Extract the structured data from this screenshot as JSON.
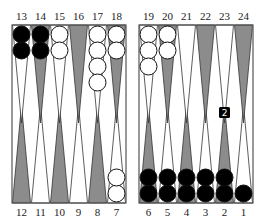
{
  "board": {
    "colors": {
      "background": "#ffffff",
      "frame": "#555555",
      "dark_point": "#8c8c8c",
      "light_point": "#ffffff",
      "black_checker": "#000000",
      "white_checker": "#ffffff"
    },
    "top_left_labels": [
      "13",
      "14",
      "15",
      "16",
      "17",
      "18"
    ],
    "top_right_labels": [
      "19",
      "20",
      "21",
      "22",
      "23",
      "24"
    ],
    "bottom_left_labels": [
      "12",
      "11",
      "10",
      "9",
      "8",
      "7"
    ],
    "bottom_right_labels": [
      "6",
      "5",
      "4",
      "3",
      "2",
      "1"
    ],
    "points": [
      {
        "point": 13,
        "checkers": 2,
        "color": "black"
      },
      {
        "point": 14,
        "checkers": 2,
        "color": "black"
      },
      {
        "point": 15,
        "checkers": 2,
        "color": "white"
      },
      {
        "point": 16,
        "checkers": 0,
        "color": null
      },
      {
        "point": 17,
        "checkers": 4,
        "color": "white"
      },
      {
        "point": 18,
        "checkers": 2,
        "color": "white"
      },
      {
        "point": 19,
        "checkers": 3,
        "color": "white"
      },
      {
        "point": 20,
        "checkers": 2,
        "color": "white"
      },
      {
        "point": 21,
        "checkers": 0,
        "color": null
      },
      {
        "point": 22,
        "checkers": 0,
        "color": null
      },
      {
        "point": 23,
        "checkers": 0,
        "color": null
      },
      {
        "point": 24,
        "checkers": 0,
        "color": null
      },
      {
        "point": 12,
        "checkers": 0,
        "color": null
      },
      {
        "point": 11,
        "checkers": 0,
        "color": null
      },
      {
        "point": 10,
        "checkers": 0,
        "color": null
      },
      {
        "point": 9,
        "checkers": 0,
        "color": null
      },
      {
        "point": 8,
        "checkers": 0,
        "color": null
      },
      {
        "point": 7,
        "checkers": 2,
        "color": "white"
      },
      {
        "point": 6,
        "checkers": 2,
        "color": "black"
      },
      {
        "point": 5,
        "checkers": 2,
        "color": "black"
      },
      {
        "point": 4,
        "checkers": 2,
        "color": "black"
      },
      {
        "point": 3,
        "checkers": 2,
        "color": "black"
      },
      {
        "point": 2,
        "checkers": 2,
        "color": "black"
      },
      {
        "point": 1,
        "checkers": 1,
        "color": "black"
      }
    ],
    "die": {
      "value": "2",
      "color": "black",
      "pip_color": "white"
    }
  }
}
